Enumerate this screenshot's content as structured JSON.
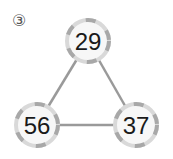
{
  "problem_label": "③",
  "nodes": [
    {
      "id": "top",
      "value": "29",
      "cx": 88,
      "cy": 41
    },
    {
      "id": "bottom-left",
      "value": "56",
      "cx": 37,
      "cy": 125
    },
    {
      "id": "bottom-right",
      "value": "37",
      "cx": 136,
      "cy": 125
    }
  ],
  "colors": {
    "edge": "#9a9a9a",
    "ring_light": "#d9d9d9",
    "ring_dark": "#a8a8a8",
    "fill": "#f7f7f7"
  }
}
